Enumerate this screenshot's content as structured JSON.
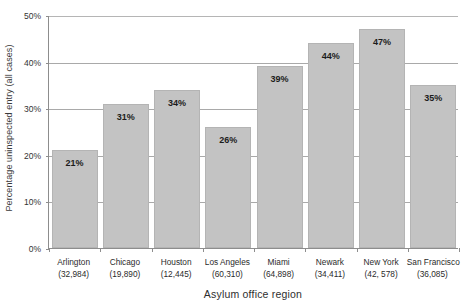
{
  "chart_data": {
    "type": "bar",
    "title": "",
    "xlabel": "Asylum office region",
    "ylabel": "Percentage uninspected entry (all cases)",
    "categories": [
      "Arlington",
      "Chicago",
      "Houston",
      "Los Angeles",
      "Miami",
      "Newark",
      "New York",
      "San Francisco"
    ],
    "category_counts": [
      "(32,984)",
      "(19,890)",
      "(12,445)",
      "(60,310)",
      "(64,898)",
      "(34,411)",
      "(42, 578)",
      "(36,085)"
    ],
    "values": [
      21,
      31,
      34,
      26,
      39,
      44,
      47,
      35
    ],
    "value_labels": [
      "21%",
      "31%",
      "34%",
      "26%",
      "39%",
      "44%",
      "47%",
      "35%"
    ],
    "ylim": [
      0,
      50
    ],
    "yticks": [
      0,
      10,
      20,
      30,
      40,
      50
    ],
    "ytick_labels": [
      "0%",
      "10%",
      "20%",
      "30%",
      "40%",
      "50%"
    ],
    "grid": true,
    "legend": "none",
    "bar_color": "#c3c3c3",
    "bar_border_color": "#b4b4b4",
    "axis_color": "#8d8d8d",
    "gridline_color": "#a9a9a9"
  }
}
